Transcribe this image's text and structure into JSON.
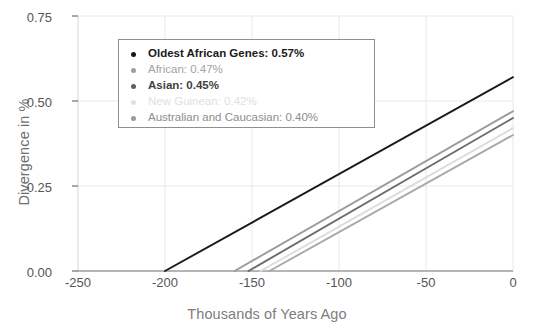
{
  "chart_data": {
    "type": "line",
    "title": "",
    "xlabel": "Thousands of Years Ago",
    "ylabel": "Divergence in %",
    "xlim": [
      -250,
      0
    ],
    "ylim": [
      0.0,
      0.75
    ],
    "xticks": [
      "-250",
      "-200",
      "-150",
      "-100",
      "-50",
      "0"
    ],
    "xtick_values": [
      -250,
      -200,
      -150,
      -100,
      -50,
      0
    ],
    "yticks": [
      "0.00",
      "0.25",
      "0.50",
      "0.75"
    ],
    "ytick_values": [
      0.0,
      0.25,
      0.5,
      0.75
    ],
    "grid": true,
    "legend_position": "upper left",
    "series": [
      {
        "name": "Oldest African Genes",
        "label": "Oldest African Genes: 0.57%",
        "divergence": 0.57,
        "color": "#1a1a1a",
        "x": [
          -200,
          0
        ],
        "y": [
          0.0,
          0.57
        ]
      },
      {
        "name": "African",
        "label": "African: 0.47%",
        "divergence": 0.47,
        "color": "#9b9b9b",
        "x": [
          -160,
          0
        ],
        "y": [
          0.0,
          0.47
        ]
      },
      {
        "name": "Asian",
        "label": "Asian: 0.45%",
        "divergence": 0.45,
        "color": "#6b6b6b",
        "x": [
          -152,
          0
        ],
        "y": [
          0.0,
          0.45
        ]
      },
      {
        "name": "New Guinean",
        "label": "New Guinean: 0.42%",
        "divergence": 0.42,
        "color": "#dcdcdc",
        "x": [
          -145,
          0
        ],
        "y": [
          0.0,
          0.42
        ]
      },
      {
        "name": "Australian and Caucasian",
        "label": "Australian and Caucasian: 0.40%",
        "divergence": 0.4,
        "color": "#a8a8a8",
        "x": [
          -140,
          0
        ],
        "y": [
          0.0,
          0.4
        ]
      }
    ]
  },
  "axes": {
    "ylabel": "Divergence in %",
    "xlabel": "Thousands of Years Ago",
    "yticks": [
      "0.75",
      "0.50",
      "0.25",
      "0.00"
    ],
    "xticks": [
      "-250",
      "-200",
      "-150",
      "-100",
      "-50",
      "0"
    ]
  },
  "legend": {
    "items": [
      {
        "label": "Oldest African Genes: 0.57%",
        "color": "#1a1a1a",
        "text_color": "#1a1a1a"
      },
      {
        "label": "African: 0.47%",
        "color": "#9e9e9e",
        "text_color": "#a2a2a2"
      },
      {
        "label": "Asian: 0.45%",
        "color": "#5f5f5f",
        "text_color": "#4a4a4a"
      },
      {
        "label": "New Guinean: 0.42%",
        "color": "#e2e2e2",
        "text_color": "#e0e0e0"
      },
      {
        "label": "Australian and Caucasian: 0.40%",
        "color": "#9a9a9a",
        "text_color": "#8d8d8d"
      }
    ]
  },
  "colors": {
    "axis": "#6f6f6f",
    "grid": "#e8e8e8",
    "background": "#ffffff"
  }
}
